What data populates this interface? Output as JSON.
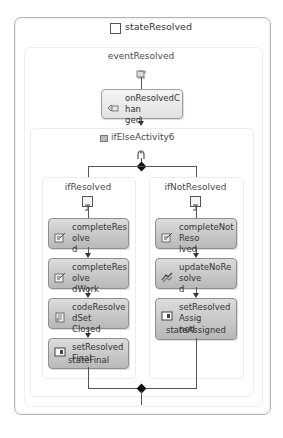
{
  "state": {
    "title": "stateResolved",
    "icon": "state-icon"
  },
  "event": {
    "label": "eventResolved",
    "icon": "event-driven-icon",
    "handler": {
      "label": "onResolvedChanged",
      "display_lines": [
        "onResolvedChan",
        "ged"
      ],
      "icon": "handle-external-event-icon"
    }
  },
  "ifelse": {
    "label": "ifElseActivity6",
    "icon": "ifelse-icon",
    "branch_icon": "branch-icon",
    "branches": [
      {
        "label": "ifResolved",
        "icon": "ifelse-branch-icon",
        "activities": [
          {
            "name": "completeResolved",
            "line1": "completeResolve",
            "line2": "d",
            "icon": "task-icon",
            "target": null
          },
          {
            "name": "completeResolvedWork",
            "line1": "completeResolve",
            "line2": "dWork",
            "icon": "task-icon",
            "target": null
          },
          {
            "name": "codeResolvedSetClosed",
            "line1": "codeResolvedSet",
            "line2": "Closed",
            "icon": "code-icon",
            "target": null
          },
          {
            "name": "setResolvedFinal",
            "line1": "setResolvedFinal",
            "line2": "",
            "icon": "set-state-icon",
            "target": "stateFinal"
          }
        ]
      },
      {
        "label": "ifNotResolved",
        "icon": "ifelse-branch-icon",
        "activities": [
          {
            "name": "completeNotResolved",
            "line1": "completeNotReso",
            "line2": "lved",
            "icon": "task-icon",
            "target": null
          },
          {
            "name": "updateNoResolved",
            "line1": "updateNoResolve",
            "line2": "d",
            "icon": "update-icon",
            "target": null
          },
          {
            "name": "setResolvedAssigned",
            "line1": "setResolvedAssig",
            "line2": "ned",
            "icon": "set-state-icon",
            "target": "stateAssigned"
          }
        ]
      }
    ]
  },
  "colors": {
    "activity_dark": "#c4c4c4",
    "activity_light": "#ececec",
    "connector": "#555555",
    "border": "#b4b4b4"
  }
}
